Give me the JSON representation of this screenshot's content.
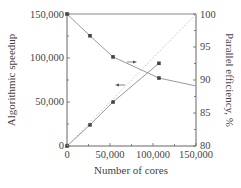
{
  "chart_data": {
    "type": "line",
    "title": "",
    "xlabel": "Number of cores",
    "ylabel": "Algorithmic speedup",
    "y2label": "Parallel efficiency, %",
    "xlim": [
      0,
      150000
    ],
    "ylim": [
      0,
      150000
    ],
    "y2lim": [
      80,
      100
    ],
    "x_ticks": [
      "0",
      "50,000",
      "100,000",
      "150,000"
    ],
    "y_ticks": [
      "0",
      "50,000",
      "100,000",
      "150,000"
    ],
    "y2_ticks": [
      "80",
      "85",
      "90",
      "95",
      "100"
    ],
    "grid": false,
    "legend": "none (arrows indicate axis for each curve)",
    "series": [
      {
        "name": "Algorithmic speedup",
        "axis": "left",
        "x": [
          0,
          26700,
          53500,
          106900
        ],
        "values": [
          0,
          24000,
          50000,
          94000
        ],
        "arrow": "left"
      },
      {
        "name": "Parallel efficiency",
        "axis": "right",
        "x": [
          0,
          26700,
          53500,
          106900
        ],
        "values": [
          100,
          96.7,
          93.5,
          90.3
        ],
        "arrow": "right"
      },
      {
        "name": "Ideal speedup",
        "axis": "left",
        "style": "dotted",
        "x": [
          0,
          150000
        ],
        "values": [
          0,
          150000
        ]
      }
    ]
  }
}
